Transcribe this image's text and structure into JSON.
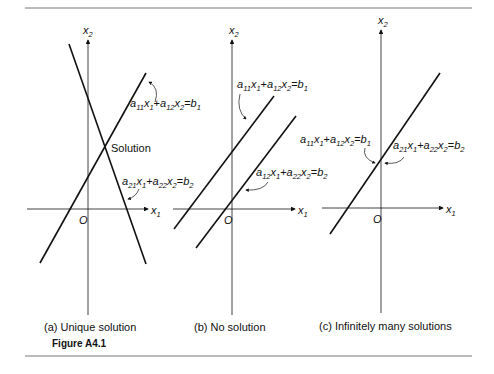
{
  "figure": {
    "label": "Figure A4.1",
    "panels": [
      {
        "id": "a",
        "caption": "(a) Unique solution",
        "axis_x": "x1",
        "axis_y": "x2",
        "origin": "O",
        "annotation": "Solution",
        "equations": [
          "a11x1+a12x2=b1",
          "a21x1+a22x2=b2"
        ]
      },
      {
        "id": "b",
        "caption": "(b) No solution",
        "axis_x": "x1",
        "axis_y": "x2",
        "origin": "O",
        "equations": [
          "a11x1+a12x2=b1",
          "a12x1+a22x2=b2"
        ]
      },
      {
        "id": "c",
        "caption": "(c) Infinitely many solutions",
        "axis_x": "x1",
        "axis_y": "x2",
        "origin": "O",
        "equations": [
          "a11x1+a12x2=b1",
          "a21x1+a22x2=b2"
        ]
      }
    ]
  },
  "captions": {
    "a": "(a) Unique solution",
    "b": "(b) No solution",
    "c": "(c) Infinitely many solutions",
    "figure": "Figure A4.1",
    "solution": "Solution",
    "origin": "O"
  }
}
